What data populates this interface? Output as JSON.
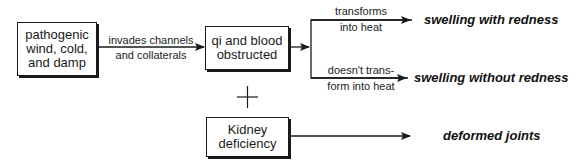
{
  "nodes": {
    "cause": {
      "label_lines": [
        "pathogenic",
        "wind, cold,",
        "and damp"
      ]
    },
    "obstruction": {
      "label_lines": [
        "qi and blood",
        "obstructed"
      ]
    },
    "kidney": {
      "label_lines": [
        "Kidney",
        "deficiency"
      ]
    }
  },
  "edges": {
    "cause_to_obstruction": {
      "label_lines": [
        "invades channels",
        "and collaterals"
      ]
    },
    "to_redness": {
      "label_lines": [
        "transforms",
        "into heat"
      ]
    },
    "to_no_redness": {
      "label_lines": [
        "doesn't trans-",
        "form into heat"
      ]
    }
  },
  "combine_symbol": "+",
  "outcomes": {
    "with_redness": "swelling with redness",
    "without_redness": "swelling without redness",
    "deformed": "deformed joints"
  }
}
